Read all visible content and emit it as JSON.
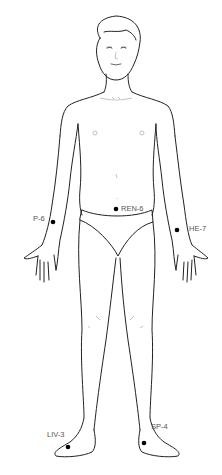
{
  "figure": {
    "point_color": "#000000",
    "label_color": "#555555"
  },
  "points": [
    {
      "id": "P-6",
      "label": "P-6",
      "x": 53,
      "y": 222
    },
    {
      "id": "REN-6",
      "label": "REN-6",
      "x": 116,
      "y": 209
    },
    {
      "id": "HE-7",
      "label": "HE-7",
      "x": 177,
      "y": 230
    },
    {
      "id": "LIV-3",
      "label": "LIV-3",
      "x": 68,
      "y": 447
    },
    {
      "id": "SP-4",
      "label": "SP-4",
      "x": 144,
      "y": 443
    }
  ]
}
